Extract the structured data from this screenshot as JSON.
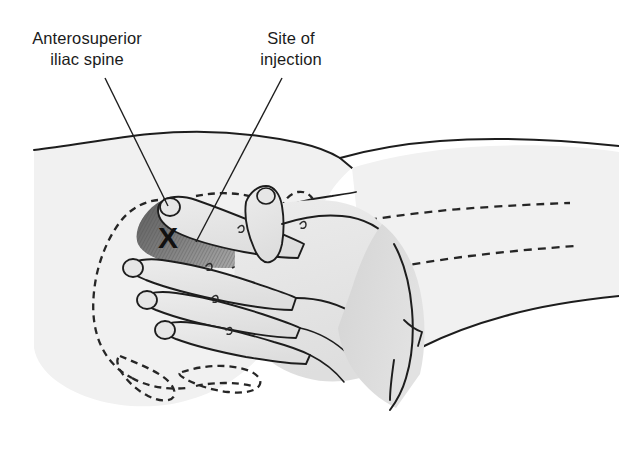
{
  "figure": {
    "caption": "",
    "labels": [
      {
        "id": "anterosuperior-iliac-spine",
        "text": "Anterosuperior\niliac spine",
        "leader_from": [
          150,
          76
        ],
        "leader_to": [
          166,
          203
        ]
      },
      {
        "id": "site-of-injection",
        "text": "Site of\ninjection",
        "leader_from": [
          272,
          76
        ],
        "leader_to": [
          198,
          240
        ]
      }
    ],
    "marker": {
      "id": "injection-x-marker",
      "text": "X",
      "x": 168,
      "y": 240
    },
    "colors": {
      "skin_fill": "#f1f1f1",
      "hand_fill": "#e8e8e8",
      "forearm_fill": "#dcdcdc",
      "shaded_muscle": "#6f6f6f",
      "outline": "#1d1d1d",
      "dashed_bone": "#262626",
      "label_text": "#1b1b1b",
      "background": "#ffffff"
    },
    "parts": [
      {
        "name": "torso-hip-outline",
        "style": "solid"
      },
      {
        "name": "thigh-outline",
        "style": "solid"
      },
      {
        "name": "iliac-crest-dashed-outline",
        "style": "dashed"
      },
      {
        "name": "femur-dashed-outline",
        "style": "dashed"
      },
      {
        "name": "greater-trochanter-dashed-outline",
        "style": "dashed"
      },
      {
        "name": "practitioner-hand",
        "style": "solid"
      },
      {
        "name": "practitioner-forearm",
        "style": "solid"
      },
      {
        "name": "gluteus-medius-shaded-triangle",
        "style": "hatched"
      }
    ]
  }
}
